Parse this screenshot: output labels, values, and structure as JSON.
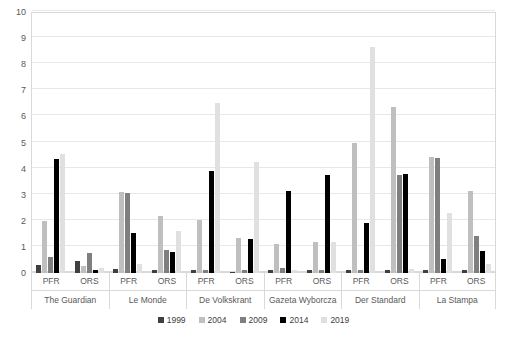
{
  "chart_data": {
    "type": "bar",
    "title": "",
    "subtitle": "",
    "xlabel": "",
    "ylabel": "",
    "ylim": [
      0,
      10
    ],
    "ytick_labels": [
      "0",
      "1",
      "2",
      "3",
      "4",
      "5",
      "6",
      "7",
      "8",
      "9",
      "10"
    ],
    "grid": true,
    "legend_position": "bottom",
    "series_names": [
      "1999",
      "2004",
      "2009",
      "2014",
      "2019"
    ],
    "series_colors": [
      "#404040",
      "#bfbfbf",
      "#7f7f7f",
      "#000000",
      "#e0e0e0"
    ],
    "subcategories": [
      "PFR",
      "ORS"
    ],
    "categories": [
      "The Guardian",
      "Le Monde",
      "De Volkskrant",
      "Gazeta Wyborcza",
      "Der Standard",
      "La Stampa"
    ],
    "groups": [
      {
        "category": "The Guardian",
        "subgroups": [
          {
            "name": "PFR",
            "values": [
              0.3,
              2.0,
              0.6,
              4.35,
              4.55
            ]
          },
          {
            "name": "ORS",
            "values": [
              0.45,
              0.25,
              0.75,
              0.1,
              0.2
            ]
          }
        ]
      },
      {
        "category": "Le Monde",
        "subgroups": [
          {
            "name": "PFR",
            "values": [
              0.15,
              3.1,
              3.05,
              1.55,
              0.35
            ]
          },
          {
            "name": "ORS",
            "values": [
              0.1,
              2.2,
              0.9,
              0.8,
              1.6
            ]
          }
        ]
      },
      {
        "category": "De Volkskrant",
        "subgroups": [
          {
            "name": "PFR",
            "values": [
              0.1,
              2.05,
              0.1,
              3.9,
              6.5
            ]
          },
          {
            "name": "ORS",
            "values": [
              0.05,
              1.35,
              0.1,
              1.3,
              4.25
            ]
          }
        ]
      },
      {
        "category": "Gazeta Wyborcza",
        "subgroups": [
          {
            "name": "PFR",
            "values": [
              0.1,
              1.1,
              0.2,
              3.15,
              0.1
            ]
          },
          {
            "name": "ORS",
            "values": [
              0.1,
              1.2,
              0.1,
              3.75,
              1.2
            ]
          }
        ]
      },
      {
        "category": "Der Standard",
        "subgroups": [
          {
            "name": "PFR",
            "values": [
              0.1,
              5.0,
              0.1,
              1.9,
              8.65
            ]
          },
          {
            "name": "ORS",
            "values": [
              0.1,
              6.35,
              3.75,
              3.8,
              0.15
            ]
          }
        ]
      },
      {
        "category": "La Stampa",
        "subgroups": [
          {
            "name": "PFR",
            "values": [
              0.1,
              4.45,
              4.4,
              0.55,
              2.3,
              0.15
            ]
          },
          {
            "name": "ORS",
            "values": [
              0.1,
              3.15,
              1.4,
              0.85,
              0.35
            ]
          }
        ]
      }
    ]
  }
}
